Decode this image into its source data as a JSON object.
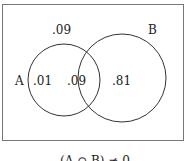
{
  "diagram": {
    "type": "venn",
    "sets": [
      "A",
      "B"
    ],
    "labels": {
      "outside": ".09",
      "a_only": ".01",
      "a_and_b": ".09",
      "b_only": ".81",
      "set_a": "A",
      "set_b": "B"
    },
    "caption": "(A ∩ B) ≠ 0"
  }
}
